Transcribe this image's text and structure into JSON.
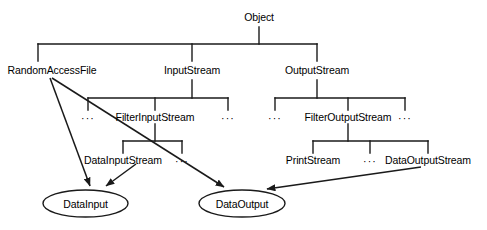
{
  "diagram": {
    "stroke_color": "#1a1a1a",
    "text_color": "#000000",
    "background_color": "#ffffff",
    "ellipsis": "···",
    "classes": {
      "object": "Object",
      "random_access_file": "RandomAccessFile",
      "input_stream": "InputStream",
      "output_stream": "OutputStream",
      "filter_input_stream": "FilterInputStream",
      "filter_output_stream": "FilterOutputStream",
      "data_input_stream": "DataInputStream",
      "print_stream": "PrintStream",
      "data_output_stream": "DataOutputStream"
    },
    "interfaces": {
      "data_input": "DataInput",
      "data_output": "DataOutput"
    }
  }
}
